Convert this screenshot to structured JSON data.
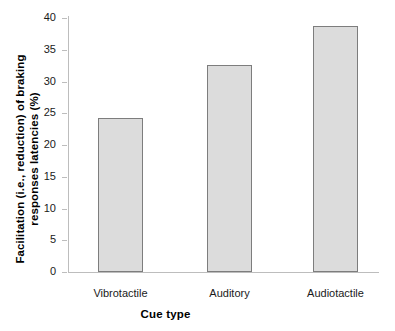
{
  "chart_data": {
    "type": "bar",
    "title": "",
    "xlabel": "Cue type",
    "ylabel": "Facilitation (i.e., reduction) of braking responses latencies (%)",
    "ylabel_line1": "Facilitation (i.e., reduction) of braking",
    "ylabel_line2": "responses latencies (%)",
    "categories": [
      "Vibrotactile",
      "Auditory",
      "Audiotactile"
    ],
    "values": [
      24.2,
      32.6,
      38.8
    ],
    "ylim": [
      0,
      40
    ],
    "ytick_step": 5,
    "yticks": [
      0,
      5,
      10,
      15,
      20,
      25,
      30,
      35,
      40
    ],
    "ytick_labels": [
      "0",
      "5",
      "10",
      "15",
      "20",
      "25",
      "30",
      "35",
      "40"
    ],
    "grid": false,
    "legend": null,
    "bar_fill_color": "#dcdcdc",
    "bar_border_color": "#7d7d7d",
    "axis_color": "#bdbdbd",
    "background_color": "#ffffff"
  }
}
